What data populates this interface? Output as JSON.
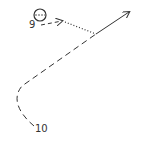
{
  "diagram": {
    "type": "play-route",
    "colors": {
      "ink": "#333333",
      "background": "#ffffff"
    },
    "nodes": [
      {
        "id": "player-marker",
        "shape": "circle",
        "label": "9",
        "cx": 40,
        "cy": 15,
        "r": 6
      },
      {
        "id": "player-10",
        "label": "10"
      }
    ],
    "labels": {
      "player_9": "9",
      "player_10": "10"
    },
    "edges": [
      {
        "from": "9",
        "style": "dashed",
        "arrow": true,
        "direction": "right"
      },
      {
        "from": "9-arrow",
        "to": "junction",
        "style": "dotted"
      },
      {
        "from": "10",
        "to": "junction",
        "style": "dashed",
        "curve": true
      },
      {
        "from": "junction",
        "to": "upper-right",
        "style": "solid",
        "arrow": true
      }
    ]
  }
}
